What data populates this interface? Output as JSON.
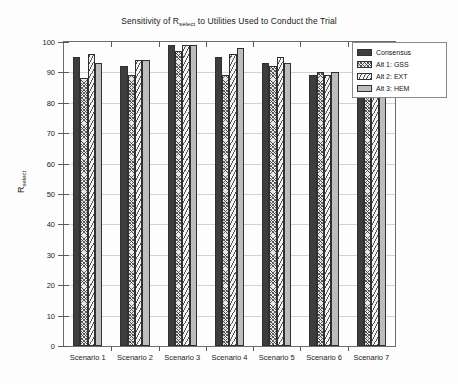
{
  "chart_data": {
    "type": "bar",
    "title_main_pre": "Sensitivity of R",
    "title_sub": "select",
    "title_main_post": " to Utilities Used to Conduct the Trial",
    "xlabel": "",
    "ylabel": "R_select",
    "ylabel_main": "R",
    "ylabel_sub": "select",
    "categories": [
      "Scenario 1",
      "Scenario 2",
      "Scenario 3",
      "Scenario 4",
      "Scenario 5",
      "Scenario 6",
      "Scenario 7"
    ],
    "series": [
      {
        "name": "Consensus",
        "values": [
          95,
          92,
          99,
          95,
          93,
          89,
          88
        ]
      },
      {
        "name": "Alt 1: GSS",
        "values": [
          88,
          89,
          97,
          89,
          92,
          90,
          85
        ]
      },
      {
        "name": "Alt 2: EXT",
        "values": [
          96,
          94,
          99,
          96,
          95,
          89,
          90
        ]
      },
      {
        "name": "Alt 3: HEM",
        "values": [
          93,
          94,
          99,
          98,
          93,
          90,
          83
        ]
      }
    ],
    "ylim": [
      0,
      100
    ],
    "yticks": [
      0,
      10,
      20,
      30,
      40,
      50,
      60,
      70,
      80,
      90,
      100
    ],
    "ytick_labels": [
      "0",
      "10",
      "20",
      "30",
      "40",
      "50",
      "60",
      "70",
      "80",
      "90",
      "100"
    ],
    "grid": true,
    "grid_axis": "y",
    "legend_position": "upper right",
    "colors": {
      "series_0": "#3d3d3d",
      "series_1": "#e8e8e8",
      "series_2": "#f4f4f4",
      "series_3": "#bdbdbd",
      "grid": "#d2d2d2",
      "axis": "#6d6d6d",
      "text": "#1a1a1a",
      "background": "#fdfdfd"
    },
    "legend": [
      {
        "label": "Consensus"
      },
      {
        "label": "Alt 1: GSS"
      },
      {
        "label": "Alt 2: EXT"
      },
      {
        "label": "Alt 3: HEM"
      }
    ]
  }
}
